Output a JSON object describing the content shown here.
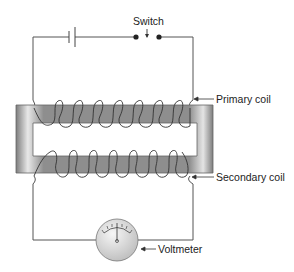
{
  "diagram": {
    "type": "transformer circuit",
    "labels": {
      "switch": "Switch",
      "primary_coil": "Primary coil",
      "secondary_coil": "Secondary coil",
      "voltmeter": "Voltmeter"
    },
    "components": [
      "battery",
      "switch",
      "primary coil",
      "iron core",
      "secondary coil",
      "voltmeter"
    ],
    "colors": {
      "wire": "#555555",
      "core_dark": "#8a8a8a",
      "core_light": "#e6e6e6",
      "text": "#222222"
    }
  }
}
